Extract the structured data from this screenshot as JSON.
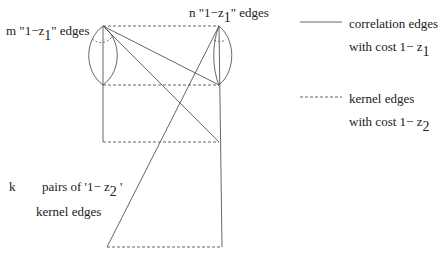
{
  "labels": {
    "left_group": {
      "prefix": "m \"1−z",
      "sub": "1",
      "suffix": "\" edges"
    },
    "right_group": {
      "prefix": "n \"1−z",
      "sub": "1",
      "suffix": "\" edges"
    },
    "k_label": "k",
    "pairs_line1": {
      "prefix": "pairs of '1−  z",
      "sub": "2",
      "suffix": " '"
    },
    "pairs_line2": "kernel edges"
  },
  "legend": {
    "correlation": {
      "line1": "correlation edges",
      "line2_prefix": "with cost  1− z",
      "line2_sub": "1"
    },
    "kernel": {
      "line1": "kernel edges",
      "line2_prefix": "with cost   1− z",
      "line2_sub": "2"
    }
  },
  "colors": {
    "stroke": "#555555",
    "text": "#222222"
  }
}
